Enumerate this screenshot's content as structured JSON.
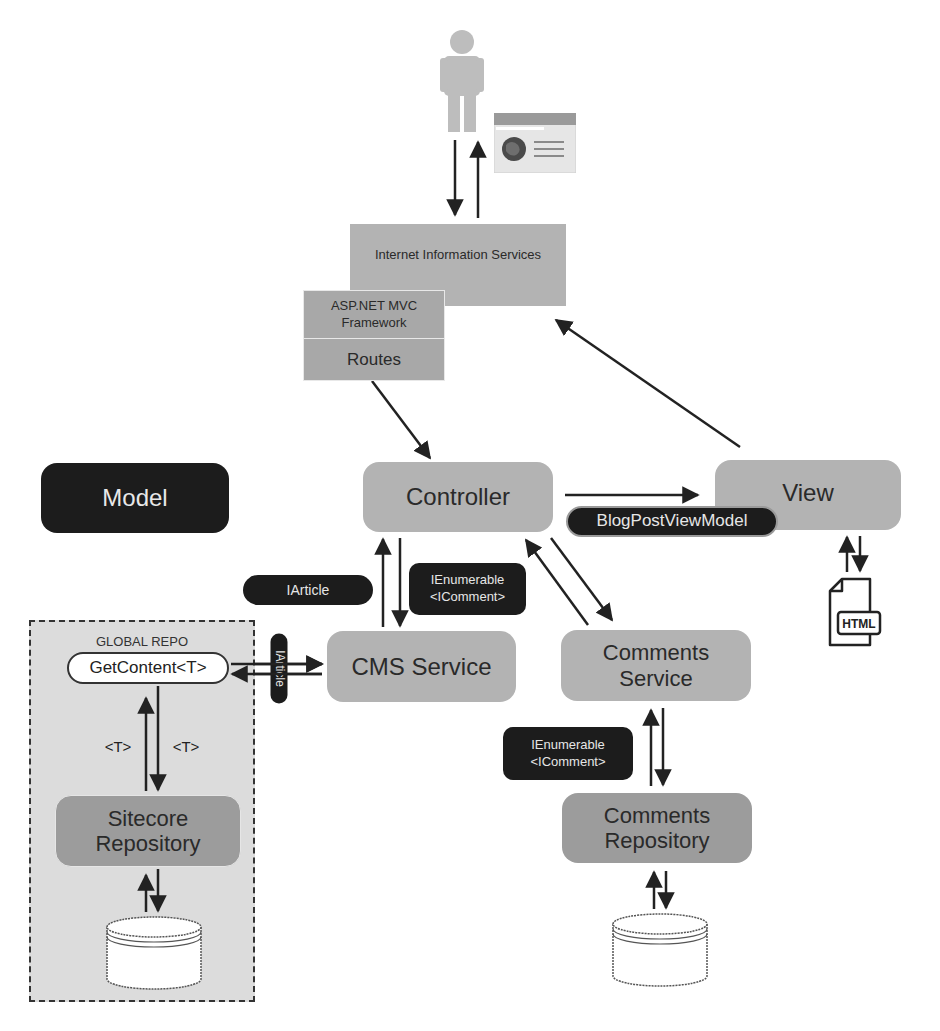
{
  "diagram": {
    "actors": {
      "user": {
        "icon": "person-icon"
      },
      "browser": {
        "icon": "browser-window-icon"
      }
    },
    "iis": {
      "label": "Internet Information Services"
    },
    "aspnet": {
      "framework_label": "ASP.NET MVC Framework",
      "routes_label": "Routes"
    },
    "model": {
      "label": "Model"
    },
    "controller": {
      "label": "Controller"
    },
    "view": {
      "label": "View"
    },
    "view_model_pill": {
      "label": "BlogPostViewModel"
    },
    "html_file": {
      "label": "HTML",
      "icon": "html-file-icon"
    },
    "iarticle_pill": {
      "label": "IArticle"
    },
    "ienumerable_pill_top": {
      "line1": "IEnumerable",
      "line2": "<IComment>"
    },
    "cms_service": {
      "label": "CMS Service"
    },
    "comments_service": {
      "label": "Comments Service"
    },
    "ienumerable_pill_bottom": {
      "line1": "IEnumerable",
      "line2": "<IComment>"
    },
    "global_repo": {
      "title": "GLOBAL REPO",
      "get_content": "GetContent<T>",
      "type_left": "<T>",
      "type_right": "<T>",
      "iarticle_vertical": "IArticle"
    },
    "sitecore_repository": {
      "label": "Sitecore Repository"
    },
    "comments_repository": {
      "label": "Comments Repository"
    },
    "databases": [
      {
        "name": "sitecore-database",
        "icon": "database-icon"
      },
      {
        "name": "comments-database",
        "icon": "database-icon"
      }
    ]
  },
  "colors": {
    "gray_box": "#b3b3b3",
    "dark_gray_box": "#9c9c9c",
    "black_box": "#1c1c1c",
    "global_repo_fill": "#dcdcdc",
    "arrow": "#222222"
  }
}
